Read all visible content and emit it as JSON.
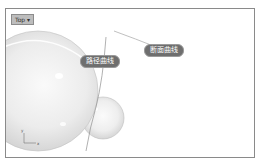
{
  "viewport": {
    "name": "Top",
    "tab_label": "Top ▾",
    "background": "#ffffff",
    "border_color": "#8a8a8a"
  },
  "scene": {
    "objects": [
      {
        "type": "sphere",
        "name": "large-sphere",
        "color": "#e6e6e6"
      },
      {
        "type": "sphere",
        "name": "small-sphere",
        "color": "#e8e8e8"
      },
      {
        "type": "curve",
        "name": "path-curve"
      },
      {
        "type": "curve",
        "name": "section-curve"
      }
    ]
  },
  "annotations": {
    "path_curve_label": "路径曲线",
    "section_curve_label": "断面曲线"
  },
  "axes": {
    "y_label": "y",
    "x_label": "x"
  }
}
